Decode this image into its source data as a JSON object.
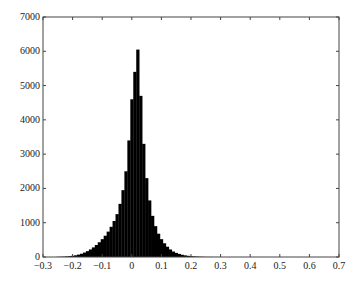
{
  "chart_data": {
    "type": "bar",
    "title": "",
    "xlabel": "",
    "ylabel": "",
    "xlim": [
      -0.3,
      0.7
    ],
    "ylim": [
      0,
      7000
    ],
    "grid": false,
    "legend": null,
    "x_ticks": [
      "-0.3",
      "-0.2",
      "-0.1",
      "0",
      "0.1",
      "0.2",
      "0.3",
      "0.4",
      "0.5",
      "0.6",
      "0.7"
    ],
    "y_ticks": [
      "0",
      "1000",
      "2000",
      "3000",
      "4000",
      "5000",
      "6000",
      "7000"
    ],
    "bar_color": "#000000",
    "bin_width": 0.01,
    "categories": [
      -0.25,
      -0.24,
      -0.23,
      -0.22,
      -0.21,
      -0.2,
      -0.19,
      -0.18,
      -0.17,
      -0.16,
      -0.15,
      -0.14,
      -0.13,
      -0.12,
      -0.11,
      -0.1,
      -0.09,
      -0.08,
      -0.07,
      -0.06,
      -0.05,
      -0.04,
      -0.03,
      -0.02,
      -0.01,
      0,
      0.01,
      0.02,
      0.03,
      0.04,
      0.05,
      0.06,
      0.07,
      0.08,
      0.09,
      0.1,
      0.11,
      0.12,
      0.13,
      0.14,
      0.15,
      0.16,
      0.17,
      0.18,
      0.19,
      0.2,
      0.21,
      0.22,
      0.23,
      0.24,
      0.25,
      0.26,
      0.27,
      0.28,
      0.29,
      0.3
    ],
    "values": [
      5,
      8,
      12,
      18,
      25,
      35,
      50,
      70,
      95,
      130,
      170,
      220,
      280,
      350,
      430,
      520,
      620,
      740,
      880,
      1050,
      1250,
      1550,
      1950,
      2500,
      3400,
      4600,
      5400,
      6050,
      4700,
      3300,
      2300,
      1650,
      1200,
      900,
      680,
      520,
      400,
      300,
      220,
      160,
      120,
      90,
      65,
      48,
      35,
      25,
      18,
      13,
      9,
      6,
      4,
      3,
      2,
      1,
      1,
      0
    ]
  }
}
